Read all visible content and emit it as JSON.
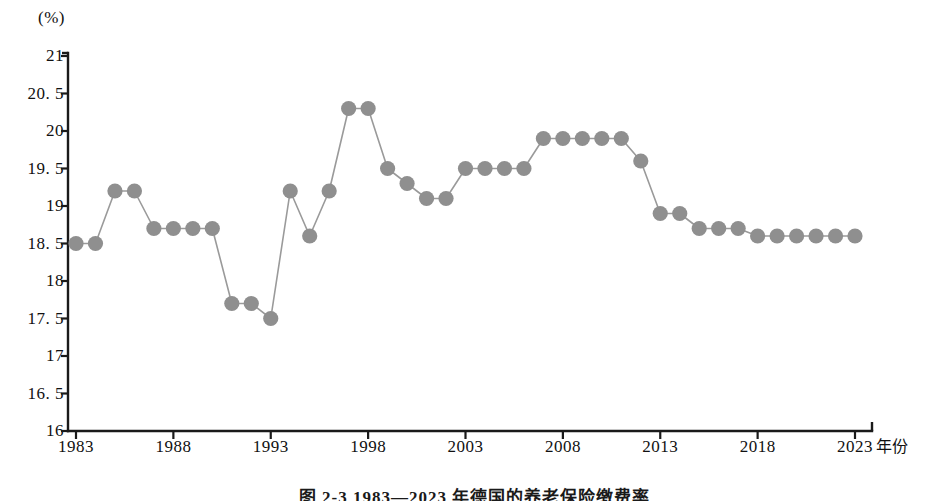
{
  "chart_data": {
    "type": "line",
    "title": "",
    "xlabel": "年份",
    "ylabel": "(%)",
    "unit_label": "(%)",
    "ylim": [
      16,
      21
    ],
    "xlim": [
      1983,
      2023
    ],
    "grid": false,
    "legend": null,
    "marker": "filled-circle",
    "marker_color": "#8f8f8f",
    "line_color": "#9a9a9a",
    "axis_color": "#1a1a1a",
    "ytick_labels": [
      "21",
      "20. 5",
      "20",
      "19. 5",
      "19",
      "18. 5",
      "18",
      "17. 5",
      "17",
      "16. 5",
      "16"
    ],
    "ytick_values": [
      21,
      20.5,
      20,
      19.5,
      19,
      18.5,
      18,
      17.5,
      17,
      16.5,
      16
    ],
    "xtick_labels": [
      "1983",
      "1988",
      "1993",
      "1998",
      "2003",
      "2008",
      "2013",
      "2018",
      "2023"
    ],
    "xtick_values": [
      1983,
      1988,
      1993,
      1998,
      2003,
      2008,
      2013,
      2018,
      2023
    ],
    "x": [
      1983,
      1984,
      1985,
      1986,
      1987,
      1988,
      1989,
      1990,
      1991,
      1992,
      1993,
      1994,
      1995,
      1996,
      1997,
      1998,
      1999,
      2000,
      2001,
      2002,
      2003,
      2004,
      2005,
      2006,
      2007,
      2008,
      2009,
      2010,
      2011,
      2012,
      2013,
      2014,
      2015,
      2016,
      2017,
      2018,
      2019,
      2020,
      2021,
      2022,
      2023
    ],
    "values": [
      18.5,
      18.5,
      19.2,
      19.2,
      18.7,
      18.7,
      18.7,
      18.7,
      17.7,
      17.7,
      17.5,
      19.2,
      18.6,
      19.2,
      20.3,
      20.3,
      19.5,
      19.3,
      19.1,
      19.1,
      19.5,
      19.5,
      19.5,
      19.5,
      19.9,
      19.9,
      19.9,
      19.9,
      19.9,
      19.6,
      18.9,
      18.9,
      18.7,
      18.7,
      18.7,
      18.6,
      18.6,
      18.6,
      18.6,
      18.6,
      18.6
    ],
    "series": [
      {
        "name": "养老保险缴费率",
        "values": [
          18.5,
          18.5,
          19.2,
          19.2,
          18.7,
          18.7,
          18.7,
          18.7,
          17.7,
          17.7,
          17.5,
          19.2,
          18.6,
          19.2,
          20.3,
          20.3,
          19.5,
          19.3,
          19.1,
          19.1,
          19.5,
          19.5,
          19.5,
          19.5,
          19.9,
          19.9,
          19.9,
          19.9,
          19.9,
          19.6,
          18.9,
          18.9,
          18.7,
          18.7,
          18.7,
          18.6,
          18.6,
          18.6,
          18.6,
          18.6,
          18.6
        ]
      }
    ]
  },
  "caption": {
    "text": "图 2-3    1983—2023 年德国的养老保险缴费率"
  }
}
